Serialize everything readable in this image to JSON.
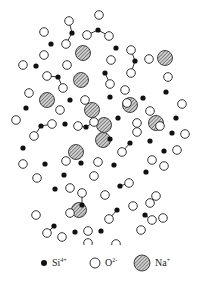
{
  "diagram": {
    "colors": {
      "si": "#111111",
      "o_fill": "#ffffff",
      "o_stroke": "#333333",
      "na_fill": "#9a9a9a",
      "bond": "#333333"
    },
    "si": [
      [
        51,
        44
      ],
      [
        72,
        33
      ],
      [
        98,
        30
      ],
      [
        116,
        48
      ],
      [
        135,
        61
      ],
      [
        105,
        73
      ],
      [
        36,
        66
      ],
      [
        58,
        77
      ],
      [
        70,
        100
      ],
      [
        26,
        108
      ],
      [
        41,
        126
      ],
      [
        65,
        124
      ],
      [
        86,
        127
      ],
      [
        118,
        118
      ],
      [
        110,
        97
      ],
      [
        143,
        98
      ],
      [
        166,
        92
      ],
      [
        110,
        139
      ],
      [
        130,
        143
      ],
      [
        150,
        141
      ],
      [
        176,
        118
      ],
      [
        172,
        133
      ],
      [
        164,
        151
      ],
      [
        23,
        148
      ],
      [
        45,
        164
      ],
      [
        64,
        175
      ],
      [
        81,
        163
      ],
      [
        114,
        165
      ],
      [
        146,
        172
      ],
      [
        120,
        186
      ],
      [
        55,
        189
      ],
      [
        82,
        205
      ],
      [
        54,
        226
      ],
      [
        75,
        232
      ],
      [
        101,
        231
      ],
      [
        117,
        210
      ],
      [
        145,
        215
      ]
    ],
    "o": [
      [
        44,
        32
      ],
      [
        66,
        44
      ],
      [
        69,
        21
      ],
      [
        87,
        35
      ],
      [
        99,
        15
      ],
      [
        109,
        36
      ],
      [
        131,
        50
      ],
      [
        111,
        60
      ],
      [
        149,
        59
      ],
      [
        131,
        73
      ],
      [
        168,
        77
      ],
      [
        23,
        65
      ],
      [
        44,
        55
      ],
      [
        47,
        76
      ],
      [
        67,
        65
      ],
      [
        63,
        88
      ],
      [
        85,
        100
      ],
      [
        29,
        93
      ],
      [
        16,
        120
      ],
      [
        34,
        136
      ],
      [
        52,
        124
      ],
      [
        78,
        126
      ],
      [
        94,
        122
      ],
      [
        60,
        110
      ],
      [
        110,
        84
      ],
      [
        127,
        103
      ],
      [
        125,
        90
      ],
      [
        137,
        132
      ],
      [
        137,
        123
      ],
      [
        150,
        111
      ],
      [
        160,
        126
      ],
      [
        182,
        104
      ],
      [
        185,
        134
      ],
      [
        177,
        150
      ],
      [
        122,
        152
      ],
      [
        152,
        160
      ],
      [
        164,
        166
      ],
      [
        23,
        164
      ],
      [
        37,
        178
      ],
      [
        70,
        188
      ],
      [
        66,
        161
      ],
      [
        98,
        162
      ],
      [
        94,
        176
      ],
      [
        82,
        193
      ],
      [
        105,
        195
      ],
      [
        129,
        183
      ],
      [
        133,
        206
      ],
      [
        156,
        196
      ],
      [
        152,
        220
      ],
      [
        163,
        218
      ],
      [
        36,
        215
      ],
      [
        47,
        233
      ],
      [
        62,
        237
      ],
      [
        70,
        213
      ],
      [
        88,
        231
      ],
      [
        109,
        219
      ],
      [
        116,
        244
      ],
      [
        88,
        243
      ],
      [
        141,
        230
      ],
      [
        150,
        203
      ]
    ],
    "na": [
      [
        83,
        53
      ],
      [
        165,
        58
      ],
      [
        81,
        80
      ],
      [
        47,
        100
      ],
      [
        92,
        110
      ],
      [
        130,
        105
      ],
      [
        156,
        123
      ],
      [
        104,
        125
      ],
      [
        76,
        152
      ],
      [
        103,
        140
      ],
      [
        79,
        210
      ]
    ],
    "bonds_note": "bonds drawn between Si and nearest O atoms (within 12px)"
  },
  "legend": {
    "items": [
      {
        "symbol": "si",
        "label": "Si",
        "charge": "4+"
      },
      {
        "symbol": "o",
        "label": "O",
        "charge": "2-"
      },
      {
        "symbol": "na",
        "label": "Na",
        "charge": "+"
      }
    ]
  }
}
